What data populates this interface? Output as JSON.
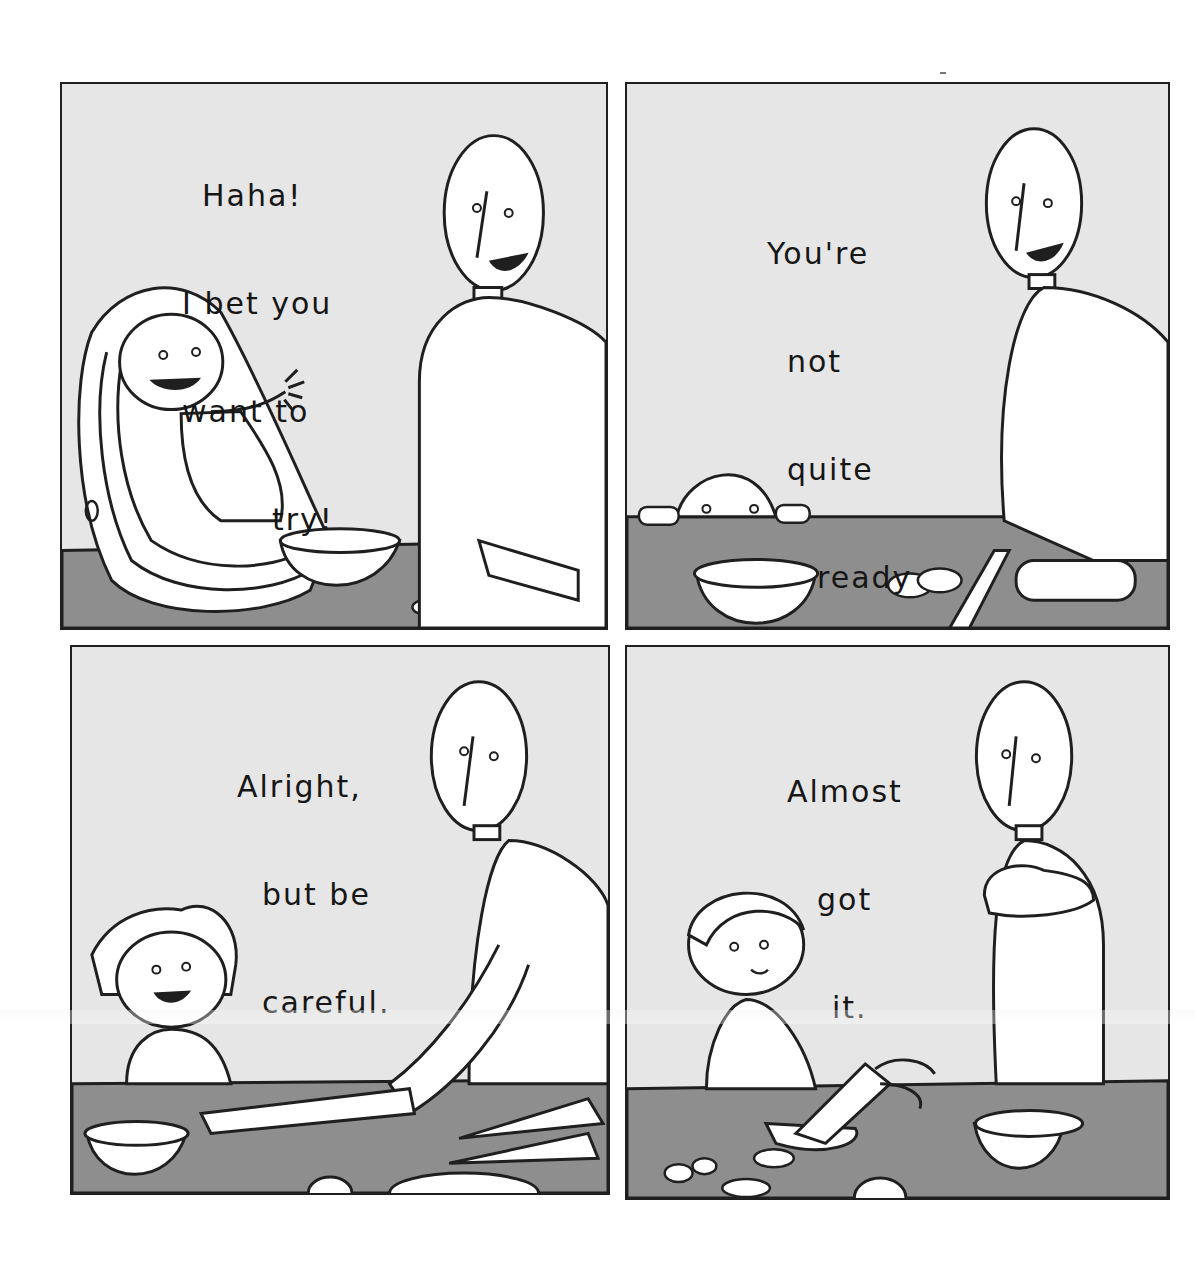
{
  "comic": {
    "panel_count": 4,
    "colors": {
      "page_background": "#ffffff",
      "panel_background": "#e6e6e6",
      "counter": "#8e8e8e",
      "line": "#1f1f1f",
      "figure_fill": "#ffffff"
    },
    "panels": [
      {
        "id": 1,
        "speech": [
          "Haha!",
          "I bet you",
          "want to",
          "try!"
        ],
        "scene": "Father cutting vegetables at counter; happy baby reaching out from a car seat"
      },
      {
        "id": 2,
        "speech": [
          "You're",
          "not",
          "quite",
          "ready",
          "yet."
        ],
        "scene": "Toddler peeking over counter edge; father slicing a cucumber"
      },
      {
        "id": 3,
        "speech": [
          "Alright,",
          "but be",
          "careful."
        ],
        "scene": "Young child and father holding a knife together; carrots on counter"
      },
      {
        "id": 4,
        "speech": [
          "Almost",
          "got",
          "it."
        ],
        "scene": "Older child cutting a carrot alone; father watching with arms crossed"
      }
    ]
  }
}
